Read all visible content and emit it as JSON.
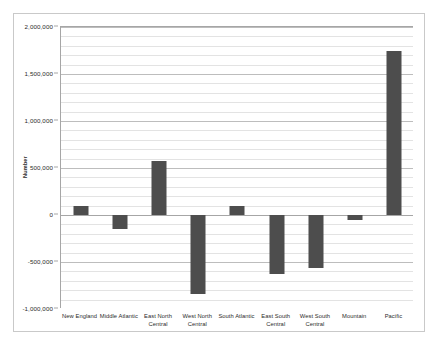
{
  "chart_data": {
    "type": "bar",
    "title": "",
    "xlabel": "",
    "ylabel": "Number",
    "categories": [
      "New England",
      "Middle Atlantic",
      "East North Central",
      "West North Central",
      "South Atlantic",
      "East South Central",
      "West South Central",
      "Mountain",
      "Pacific"
    ],
    "values": [
      100000,
      -150000,
      570000,
      -840000,
      100000,
      -630000,
      -560000,
      -50000,
      1750000
    ],
    "ylim": [
      -1000000,
      2000000
    ],
    "ytick_values": [
      -1000000,
      -500000,
      0,
      500000,
      1000000,
      1500000,
      2000000
    ],
    "ytick_labels": [
      "-1,000,000",
      "-500,000",
      "0",
      "500,000",
      "1,000,000",
      "1,500,000",
      "2,000,000"
    ],
    "minor_gridline_step": 100000,
    "grid": true,
    "legend": "none",
    "bar_color": "#4d4d4d",
    "gridline_color": "#e3e3e3",
    "axis_color": "#a6a6a6",
    "plot_background": "#ffffff",
    "border_color": "#c9c9c9"
  }
}
